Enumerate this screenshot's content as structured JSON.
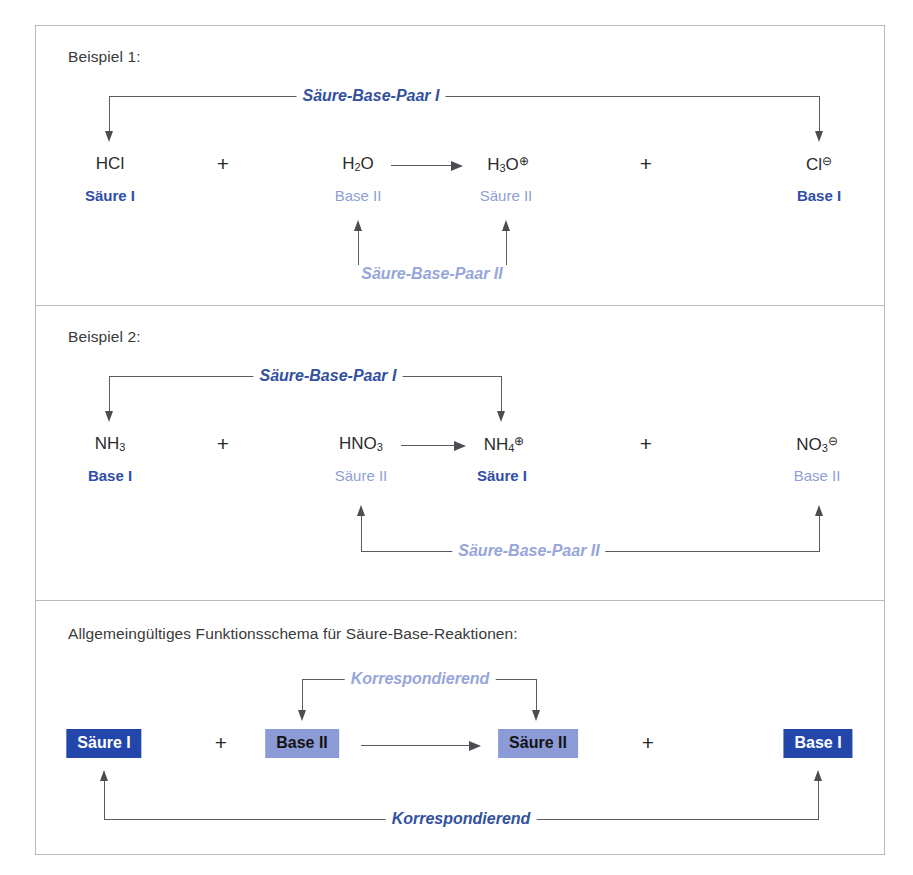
{
  "figure": {
    "colors": {
      "dark_blue_text": "#2f4da8",
      "light_blue_text": "#8f9fd4",
      "navy_box_bg": "#2346ab",
      "lilac_box_bg": "#8b9bd8",
      "line": "#5a5a60",
      "border": "#b9b9bd"
    }
  },
  "panel1": {
    "caption": "Beispiel 1:",
    "top_bracket_label": "Säure-Base-Paar I",
    "bottom_bracket_label": "Säure-Base-Paar II",
    "species": [
      {
        "formula_html": "HCl",
        "role": "Säure I",
        "role_style": "dark"
      },
      {
        "formula_html": "H<sub>2</sub>O",
        "role": "Base II",
        "role_style": "light"
      },
      {
        "formula_html": "H<sub>3</sub>O<sup>⊕</sup>",
        "role": "Säure II",
        "role_style": "light"
      },
      {
        "formula_html": "Cl<sup>⊖</sup>",
        "role": "Base I",
        "role_style": "dark"
      }
    ],
    "plus_signs": [
      "+",
      "+"
    ],
    "reaction_arrow": "→"
  },
  "panel2": {
    "caption": "Beispiel 2:",
    "top_bracket_label": "Säure-Base-Paar I",
    "bottom_bracket_label": "Säure-Base-Paar II",
    "species": [
      {
        "formula_html": "NH<sub>3</sub>",
        "role": "Base I",
        "role_style": "dark"
      },
      {
        "formula_html": "HNO<sub>3</sub>",
        "role": "Säure II",
        "role_style": "light"
      },
      {
        "formula_html": "NH<sub>4</sub><sup>⊕</sup>",
        "role": "Säure I",
        "role_style": "dark"
      },
      {
        "formula_html": "NO<sub>3</sub><sup>⊖</sup>",
        "role": "Base II",
        "role_style": "light"
      }
    ],
    "plus_signs": [
      "+",
      "+"
    ],
    "reaction_arrow": "→"
  },
  "panel3": {
    "caption": "Allgemeingültiges Funktionsschema für Säure-Base-Reaktionen:",
    "top_bracket_label": "Korrespondierend",
    "bottom_bracket_label": "Korrespondierend",
    "boxes": [
      {
        "label": "Säure I",
        "style": "navy"
      },
      {
        "label": "Base II",
        "style": "lilac"
      },
      {
        "label": "Säure II",
        "style": "lilac"
      },
      {
        "label": "Base I",
        "style": "navy"
      }
    ],
    "plus_signs": [
      "+",
      "+"
    ],
    "reaction_arrow": "→"
  }
}
